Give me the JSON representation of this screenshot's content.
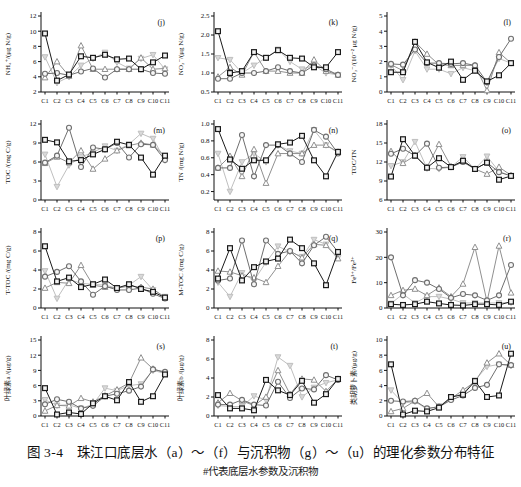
{
  "figure": {
    "caption": "图 3-4　珠江口底层水（a）～（f）与沉积物（g）～（u）的理化参数分布特征",
    "footnote": "#代表底层水参数及沉积物"
  },
  "categories": [
    "C1",
    "C2",
    "C3",
    "C4",
    "C5",
    "C6",
    "C7",
    "C8",
    "C9",
    "C10",
    "C11"
  ],
  "series_styles": [
    {
      "name": "square-series",
      "marker": "square",
      "color": "#1a1a1a",
      "fill": "#f2f2f2"
    },
    {
      "name": "circle-series",
      "marker": "circle",
      "color": "#6f6f6f",
      "fill": "#f7f7f7"
    },
    {
      "name": "triangle-up-series",
      "marker": "triangle-up",
      "color": "#909090",
      "fill": "#ffffff"
    },
    {
      "name": "triangle-down-series",
      "marker": "triangle-down",
      "color": "#bfbfbf",
      "fill": "#d9d9d9"
    }
  ],
  "chart_data": [
    {
      "type": "line",
      "panel": "(j)",
      "ylabel": "NH₄⁺/(μg N/g)",
      "ylim": [
        2,
        12
      ],
      "yticks": [
        "2",
        "4",
        "6",
        "8",
        "10",
        "12"
      ],
      "series": [
        {
          "name": "square-series",
          "values": [
            9.7,
            3.5,
            4.3,
            6.7,
            6.5,
            6.9,
            6.3,
            6.4,
            5.0,
            5.9,
            6.8
          ]
        },
        {
          "name": "circle-series",
          "values": [
            4.4,
            4.5,
            4.2,
            4.7,
            5.1,
            3.9,
            5.0,
            5.0,
            5.0,
            4.5,
            4.4
          ]
        },
        {
          "name": "triangle-up-series",
          "values": [
            3.9,
            6.0,
            4.1,
            8.1,
            5.0,
            5.0,
            5.0,
            5.0,
            6.5,
            5.0,
            5.1
          ]
        },
        {
          "name": "triangle-down-series",
          "values": [
            6.6,
            3.2,
            4.0,
            5.5,
            6.4,
            7.2,
            5.9,
            5.1,
            6.4,
            6.9,
            5.0
          ]
        }
      ]
    },
    {
      "type": "line",
      "panel": "(k)",
      "ylabel": "NO₂⁻/(μg N/g)",
      "ylim": [
        0.5,
        2.5
      ],
      "yticks": [
        "0.5",
        "1.0",
        "1.5",
        "2.0",
        "2.5"
      ],
      "series": [
        {
          "name": "square-series",
          "values": [
            2.1,
            1.0,
            1.05,
            1.55,
            1.4,
            1.6,
            1.4,
            1.38,
            1.15,
            1.15,
            1.55
          ]
        },
        {
          "name": "circle-series",
          "values": [
            0.85,
            0.85,
            1.0,
            1.0,
            1.05,
            1.15,
            1.05,
            1.0,
            1.2,
            1.1,
            0.95
          ]
        },
        {
          "name": "triangle-up-series",
          "values": [
            0.9,
            1.15,
            0.95,
            1.55,
            1.05,
            1.05,
            1.0,
            1.0,
            1.35,
            1.05,
            0.95
          ]
        },
        {
          "name": "triangle-down-series",
          "values": [
            1.4,
            1.35,
            1.0,
            1.2,
            1.4,
            1.62,
            1.3,
            1.1,
            1.2,
            1.0,
            0.95
          ]
        }
      ]
    },
    {
      "type": "line",
      "panel": "(l)",
      "ylabel": "NO₃⁻/(10⁻² μg N/g)",
      "ylim": [
        0,
        5
      ],
      "yticks": [
        "0",
        "1",
        "2",
        "3",
        "4",
        "5"
      ],
      "series": [
        {
          "name": "square-series",
          "values": [
            1.3,
            1.3,
            3.3,
            1.95,
            1.6,
            2.0,
            0.8,
            1.4,
            0.7,
            1.1,
            1.9
          ]
        },
        {
          "name": "circle-series",
          "values": [
            1.85,
            1.8,
            2.8,
            1.9,
            1.9,
            1.85,
            1.9,
            1.75,
            0.65,
            2.3,
            3.5
          ]
        },
        {
          "name": "triangle-up-series",
          "values": [
            1.8,
            1.4,
            3.3,
            2.5,
            1.8,
            1.75,
            1.75,
            1.75,
            0.1,
            2.6,
            1.9
          ]
        },
        {
          "name": "triangle-down-series",
          "values": [
            1.75,
            0.8,
            2.7,
            1.5,
            1.5,
            1.2,
            1.6,
            1.4,
            0.6,
            2.2,
            1.9
          ]
        }
      ]
    },
    {
      "type": "line",
      "panel": "(m)",
      "ylabel": "TOC /(mg C/g)",
      "ylim": [
        0,
        12
      ],
      "yticks": [
        "0",
        "3",
        "6",
        "9",
        "12"
      ],
      "series": [
        {
          "name": "square-series",
          "values": [
            9.5,
            9.1,
            6.1,
            6.3,
            7.2,
            8.0,
            9.2,
            8.7,
            6.7,
            4.0,
            7.0
          ]
        },
        {
          "name": "circle-series",
          "values": [
            5.9,
            7.0,
            11.4,
            5.2,
            8.3,
            8.0,
            9.0,
            6.7,
            8.8,
            8.7,
            6.3
          ]
        },
        {
          "name": "triangle-up-series",
          "values": [
            5.8,
            6.8,
            5.9,
            7.8,
            4.9,
            6.5,
            7.8,
            8.6,
            9.0,
            8.7,
            6.9
          ]
        },
        {
          "name": "triangle-down-series",
          "values": [
            7.2,
            2.1,
            5.5,
            6.8,
            7.5,
            8.5,
            7.8,
            8.8,
            10.5,
            9.7,
            6.3
          ]
        }
      ]
    },
    {
      "type": "line",
      "panel": "(n)",
      "ylabel": "TN /(mg N/g)",
      "ylim": [
        0.1,
        1.0
      ],
      "yticks": [
        "0.2",
        "0.4",
        "0.6",
        "0.8",
        "1.0"
      ],
      "series": [
        {
          "name": "square-series",
          "values": [
            0.94,
            0.58,
            0.47,
            0.57,
            0.57,
            0.76,
            0.78,
            0.86,
            0.57,
            0.38,
            0.67
          ]
        },
        {
          "name": "circle-series",
          "values": [
            0.48,
            0.48,
            0.87,
            0.38,
            0.75,
            0.75,
            0.65,
            0.55,
            0.93,
            0.85,
            0.65
          ]
        },
        {
          "name": "triangle-up-series",
          "values": [
            0.48,
            0.62,
            0.38,
            0.7,
            0.3,
            0.65,
            0.65,
            0.65,
            0.75,
            0.75,
            0.67
          ]
        },
        {
          "name": "triangle-down-series",
          "values": [
            0.65,
            0.2,
            0.55,
            0.65,
            0.55,
            0.75,
            0.68,
            0.65,
            0.93,
            0.75,
            0.66
          ]
        }
      ]
    },
    {
      "type": "line",
      "panel": "(o)",
      "ylabel": "TOC/TN",
      "ylim": [
        6,
        18
      ],
      "yticks": [
        "6",
        "9",
        "12",
        "15",
        "18"
      ],
      "series": [
        {
          "name": "square-series",
          "values": [
            9.7,
            15.6,
            13.0,
            11.1,
            12.6,
            11.2,
            12.2,
            10.9,
            11.9,
            9.2,
            9.8
          ]
        },
        {
          "name": "circle-series",
          "values": [
            13.3,
            14.1,
            13.0,
            14.9,
            11.1,
            11.2,
            12.0,
            10.9,
            11.9,
            10.4,
            9.8
          ]
        },
        {
          "name": "triangle-up-series",
          "values": [
            13.7,
            11.8,
            13.0,
            11.2,
            14.8,
            11.3,
            12.1,
            10.9,
            10.1,
            11.2,
            9.9
          ]
        },
        {
          "name": "triangle-down-series",
          "values": [
            11.4,
            12.0,
            15.2,
            11.0,
            10.9,
            11.2,
            12.8,
            10.9,
            12.9,
            10.5,
            9.8
          ]
        }
      ]
    },
    {
      "type": "line",
      "panel": "(p)",
      "ylabel": "T-TOC /(mg C/g)",
      "ylim": [
        0,
        8
      ],
      "yticks": [
        "0",
        "2",
        "4",
        "6",
        "8"
      ],
      "series": [
        {
          "name": "square-series",
          "values": [
            6.5,
            2.8,
            3.2,
            2.2,
            2.5,
            3.0,
            2.1,
            2.5,
            2.0,
            1.7,
            1.1
          ]
        },
        {
          "name": "circle-series",
          "values": [
            3.3,
            3.8,
            4.4,
            2.8,
            1.4,
            2.3,
            1.9,
            1.9,
            2.1,
            1.5,
            1.0
          ]
        },
        {
          "name": "triangle-up-series",
          "values": [
            2.1,
            2.7,
            2.6,
            4.5,
            2.4,
            2.2,
            2.1,
            2.3,
            2.2,
            2.0,
            1.1
          ]
        },
        {
          "name": "triangle-down-series",
          "values": [
            3.9,
            1.0,
            3.0,
            2.6,
            2.5,
            2.4,
            2.1,
            2.4,
            3.3,
            1.9,
            1.2
          ]
        }
      ]
    },
    {
      "type": "line",
      "panel": "(q)",
      "ylabel": "M-TOC /(mg C/g)",
      "ylim": [
        0,
        8
      ],
      "yticks": [
        "0",
        "2",
        "4",
        "6",
        "8"
      ],
      "series": [
        {
          "name": "square-series",
          "values": [
            3.1,
            6.3,
            2.9,
            4.3,
            4.9,
            5.2,
            7.2,
            6.3,
            4.7,
            2.4,
            5.9
          ]
        },
        {
          "name": "circle-series",
          "values": [
            2.9,
            3.1,
            7.1,
            2.5,
            7.1,
            5.7,
            6.0,
            4.7,
            6.6,
            7.5,
            5.9
          ]
        },
        {
          "name": "triangle-up-series",
          "values": [
            3.9,
            3.8,
            3.4,
            3.2,
            2.7,
            4.4,
            6.0,
            5.3,
            6.7,
            6.6,
            5.2
          ]
        },
        {
          "name": "triangle-down-series",
          "values": [
            2.7,
            1.2,
            3.7,
            2.9,
            4.8,
            6.5,
            5.9,
            5.4,
            7.2,
            6.7,
            5.3
          ]
        }
      ]
    },
    {
      "type": "line",
      "panel": "(r)",
      "ylabel": "Fe³⁺/Fe²⁺",
      "ylim": [
        0,
        30
      ],
      "yticks": [
        "0",
        "10",
        "20",
        "30"
      ],
      "series": [
        {
          "name": "square-series",
          "values": [
            1.5,
            1.2,
            1.5,
            2.5,
            1.8,
            1.2,
            1.0,
            1.5,
            1.5,
            1.2,
            2.5
          ]
        },
        {
          "name": "circle-series",
          "values": [
            20,
            5,
            11,
            10,
            7.5,
            4,
            5.5,
            5,
            3,
            5,
            17
          ]
        },
        {
          "name": "triangle-up-series",
          "values": [
            5,
            7,
            7.5,
            5,
            8,
            4.5,
            9.5,
            24,
            2.5,
            24.5,
            6
          ]
        },
        {
          "name": "triangle-down-series",
          "values": [
            1.8,
            5.5,
            2.0,
            4.5,
            4.5,
            3.5,
            2.0,
            2.0,
            2.0,
            2.0,
            2.2
          ]
        }
      ]
    },
    {
      "type": "line",
      "panel": "(s)",
      "ylabel": "叶绿素a /(μg/g)",
      "ylim": [
        0,
        15
      ],
      "yticks": [
        "0",
        "3",
        "6",
        "9",
        "12",
        "15"
      ],
      "series": [
        {
          "name": "square-series",
          "values": [
            5.5,
            0.3,
            0.7,
            0.4,
            2.5,
            3.9,
            3.1,
            6.7,
            2.8,
            3.9,
            8.2
          ]
        },
        {
          "name": "circle-series",
          "values": [
            2.3,
            3.3,
            2.8,
            1.5,
            2.0,
            3.9,
            4.4,
            5.0,
            5.8,
            9.2,
            8.7
          ]
        },
        {
          "name": "triangle-up-series",
          "values": [
            1.0,
            2.1,
            2.0,
            3.5,
            2.8,
            4.0,
            5.2,
            6.5,
            11.5,
            9.3,
            8.5
          ]
        },
        {
          "name": "triangle-down-series",
          "values": [
            3.2,
            2.1,
            2.2,
            1.5,
            2.3,
            5.5,
            5.0,
            6.0,
            6.3,
            9.0,
            8.4
          ]
        }
      ]
    },
    {
      "type": "line",
      "panel": "(t)",
      "ylabel": "叶绿素b /(μg/g)",
      "ylim": [
        0,
        8
      ],
      "yticks": [
        "0",
        "2",
        "4",
        "6",
        "8"
      ],
      "series": [
        {
          "name": "square-series",
          "values": [
            2.2,
            0.8,
            0.8,
            0.6,
            3.8,
            2.7,
            2.2,
            3.7,
            1.4,
            2.3,
            3.9
          ]
        },
        {
          "name": "circle-series",
          "values": [
            1.2,
            1.2,
            1.7,
            1.2,
            1.1,
            3.6,
            1.9,
            2.9,
            2.8,
            4.3,
            3.8
          ]
        },
        {
          "name": "triangle-up-series",
          "values": [
            1.4,
            2.4,
            1.6,
            1.1,
            2.0,
            4.8,
            2.3,
            3.9,
            3.8,
            2.6,
            3.9
          ]
        },
        {
          "name": "triangle-down-series",
          "values": [
            1.1,
            1.0,
            1.0,
            2.1,
            1.7,
            6.2,
            5.3,
            2.0,
            3.0,
            3.5,
            3.8
          ]
        }
      ]
    },
    {
      "type": "line",
      "panel": "(u)",
      "ylabel": "类胡萝卜素/(μg/g)",
      "ylim": [
        0,
        10
      ],
      "yticks": [
        "0",
        "2",
        "4",
        "6",
        "8",
        "10"
      ],
      "series": [
        {
          "name": "square-series",
          "values": [
            6.8,
            0.2,
            0.7,
            0.6,
            1.1,
            2.5,
            2.8,
            4.6,
            2.5,
            2.7,
            8.2
          ]
        },
        {
          "name": "circle-series",
          "values": [
            2.0,
            1.9,
            2.0,
            1.0,
            1.2,
            2.1,
            2.7,
            3.7,
            4.1,
            6.8,
            6.7
          ]
        },
        {
          "name": "triangle-up-series",
          "values": [
            0.6,
            1.0,
            2.0,
            3.0,
            1.2,
            2.3,
            3.4,
            4.5,
            7.0,
            8.2,
            6.7
          ]
        },
        {
          "name": "triangle-down-series",
          "values": [
            3.4,
            1.7,
            1.9,
            0.9,
            1.3,
            2.4,
            3.0,
            4.7,
            6.5,
            6.8,
            6.6
          ]
        }
      ]
    }
  ]
}
